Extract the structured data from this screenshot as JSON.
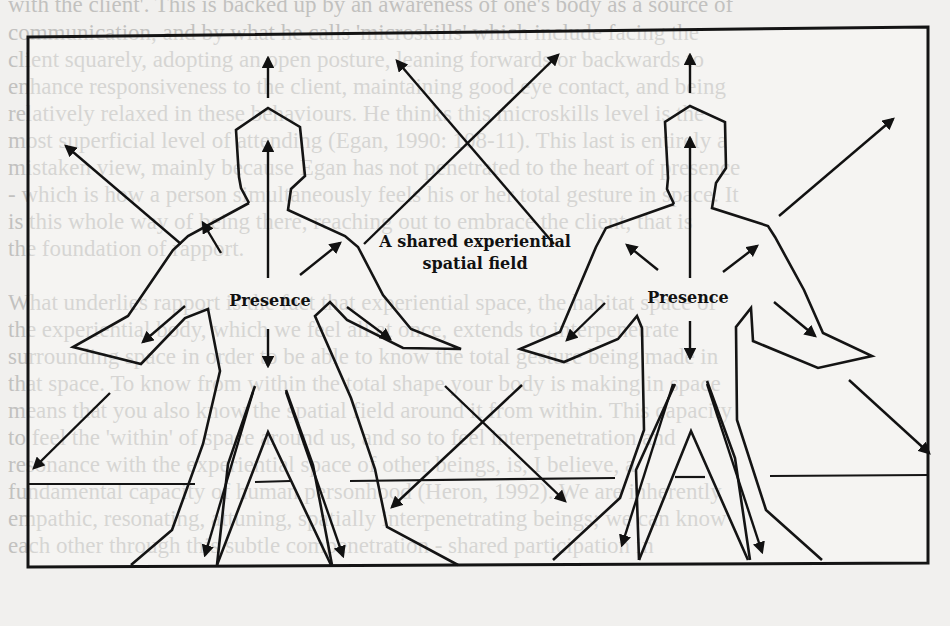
{
  "background_text": {
    "lines": [
      "with the client'. This is backed up by an awareness of one's body as a source of",
      "communication, and by what he calls 'microskills' which include facing the",
      "client squarely, adopting an open posture, leaning forwards or backwards to",
      "enhance responsiveness to the client, maintaining good eye contact, and being",
      "relatively relaxed in these behaviours. He thinks this microskills level is the",
      "most superficial level of attending (Egan, 1990: 108-11). This last is entirely a",
      "mistaken view, mainly because Egan has not penetrated to the heart of presence",
      "- which is how a person simultaneously feels his or her total gesture in space. It",
      "is this whole way of being there, reaching out to embrace the client, that is",
      "the foundation of rapport.",
      "",
      "What underlies rapport is the fact that experiential space, the habitat space of",
      "the experiential body, which we feel all at once, extends to interpenetrate",
      "surrounding space in order to be able to know the total gesture being made in",
      "that space. To know from within the total shape your body is making in space",
      "means that you also know the spatial field around it from within. This capacity",
      "to feel the 'within' of space around us, and so to feel interpenetration and",
      "resonance with the experiential space of other beings, is, I believe, a",
      "fundamental capacity of human personhood (Heron, 1992). We are inherently",
      "empathic, resonating, attuning, spatially interpenetrating beings; we can know",
      "each other through this subtle compenetration - shared participation in"
    ]
  },
  "figure": {
    "frame_color": "#141414",
    "labels": {
      "left_presence": "Presence",
      "right_presence": "Presence",
      "shared_field_line1": "A shared experiential",
      "shared_field_line2": "spatial field"
    },
    "figures": [
      {
        "name": "left-person",
        "center_x": 268
      },
      {
        "name": "right-person",
        "center_x": 690
      }
    ],
    "arrow_count": 20,
    "arrow_icon": "filled-triangle-arrowhead"
  }
}
